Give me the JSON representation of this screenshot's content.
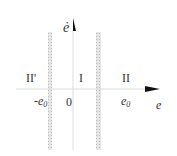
{
  "regions": {
    "left": "II'",
    "middle": "I",
    "right": "II"
  },
  "ticks": {
    "neg_e0": "-e",
    "neg_e0_sub": "0",
    "origin": "0",
    "e0": "e",
    "e0_sub": "0"
  },
  "axes": {
    "x_label": "e",
    "y_label": "ė"
  },
  "colors": {
    "axis": "#222222",
    "band": "#c8c8c8",
    "text": "#333333"
  }
}
